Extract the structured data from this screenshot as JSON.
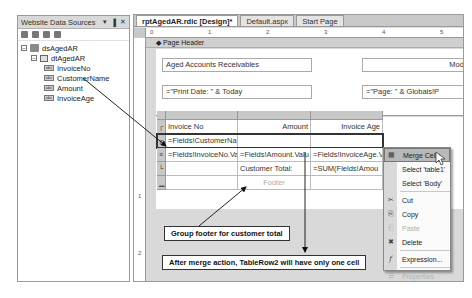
{
  "data_sources_panel": {
    "title": "Website Data Sources",
    "controls": {
      "pin": "▾",
      "autohide": "▐",
      "close": "✕"
    },
    "toolbar_icons": [
      "add-datasource-icon",
      "refresh-icon",
      "edit-icon",
      "configure-icon"
    ],
    "tree": {
      "dataset": {
        "label": "dsAgedAR",
        "expanded": true
      },
      "table": {
        "label": "dtAgedAR",
        "expanded": true
      },
      "fields": [
        {
          "label": "InvoiceNo"
        },
        {
          "label": "CustomerName"
        },
        {
          "label": "Amount"
        },
        {
          "label": "InvoiceAge"
        }
      ]
    }
  },
  "designer": {
    "tabs": [
      {
        "label": "rptAgedAR.rdlc [Design]*",
        "active": true
      },
      {
        "label": "Default.aspx",
        "active": false
      },
      {
        "label": "Start Page",
        "active": false
      }
    ],
    "ruler_h": [
      "0",
      "1",
      "2",
      "3",
      "4",
      "5"
    ],
    "ruler_v": [
      "1",
      "2"
    ],
    "page_header_label": "Page Header",
    "header_textboxes": {
      "title": "Aged Accounts Receivables",
      "right_top": "Mode",
      "print_date": "=\"Print Date: \" & Today",
      "page_expr": "=\"Page: \" & Globals!P"
    },
    "table": {
      "header": [
        "Invoice No",
        "Amount",
        "Invoice Age"
      ],
      "group_header": [
        "=Fields!CustomerNa",
        "",
        ""
      ],
      "detail": [
        "=Fields!InvoiceNo.Va",
        "=Fields!Amount.Valu",
        "=Fields!InvoiceAge.V"
      ],
      "group_footer": [
        "",
        "Customer Total:",
        "=SUM(Fields!Amou"
      ],
      "footer": [
        "",
        "Footer",
        ""
      ],
      "row_icons": [
        "table-header-icon",
        "group-header-icon",
        "detail-row-icon",
        "group-footer-icon",
        "table-footer-icon"
      ]
    }
  },
  "callouts": {
    "group_footer": "Group footer for customer total",
    "merge_note": "After merge action, TableRow2 will have only one cell"
  },
  "context_menu": {
    "items": [
      {
        "label": "Merge Cells",
        "icon": "merge-cells-icon",
        "glyph": "▦",
        "hover": true,
        "disabled": false
      },
      {
        "label": "Select 'table1'",
        "icon": "",
        "glyph": "",
        "hover": false,
        "disabled": false
      },
      {
        "label": "Select 'Body'",
        "icon": "",
        "glyph": "",
        "hover": false,
        "disabled": false
      },
      {
        "label": "Cut",
        "icon": "cut-icon",
        "glyph": "✂",
        "hover": false,
        "disabled": false
      },
      {
        "label": "Copy",
        "icon": "copy-icon",
        "glyph": "⎘",
        "hover": false,
        "disabled": false
      },
      {
        "label": "Paste",
        "icon": "paste-icon",
        "glyph": "⎗",
        "hover": false,
        "disabled": true
      },
      {
        "label": "Delete",
        "icon": "delete-icon",
        "glyph": "✖",
        "hover": false,
        "disabled": false
      },
      {
        "label": "Expression...",
        "icon": "expression-icon",
        "glyph": "f",
        "hover": false,
        "disabled": false
      },
      {
        "label": "Properties",
        "icon": "properties-icon",
        "glyph": "☰",
        "hover": false,
        "disabled": true
      }
    ]
  }
}
